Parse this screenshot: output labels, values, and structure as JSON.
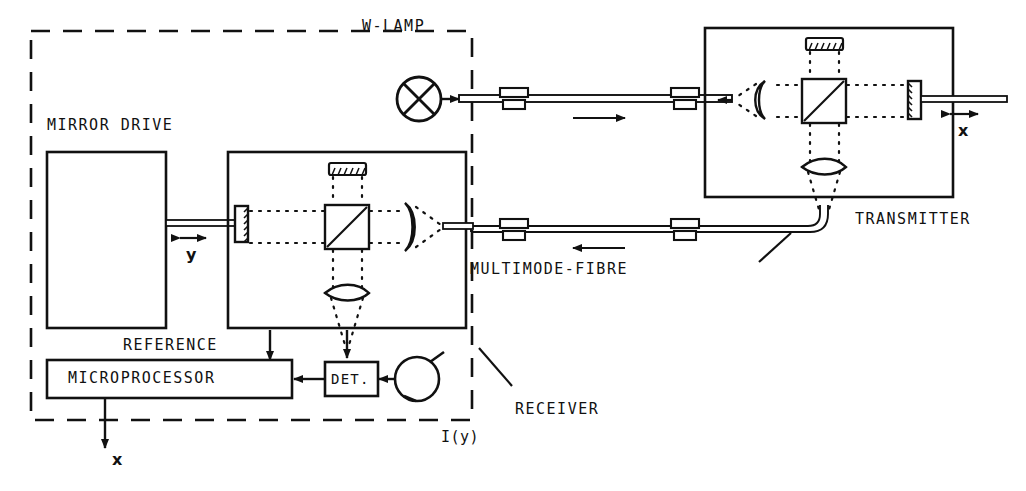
{
  "figure": {
    "stroke_color": "#111111",
    "background_color": "#ffffff"
  },
  "labels": {
    "w_lamp": "W-LAMP",
    "mirror_drive": "MIRROR DRIVE",
    "reference": "REFERENCE",
    "microprocessor": "MICROPROCESSOR",
    "detector": "DET.",
    "receiver": "RECEIVER",
    "transmitter": "TRANSMITTER",
    "multimode_fibre": "MULTIMODE-FIBRE",
    "intensity_signal": "I(y)",
    "mirror_travel_y": "y",
    "output_x": "x",
    "measurand_x": "x"
  },
  "components": {
    "receiver": {
      "name": "RECEIVER",
      "enclosure": "dashed",
      "blocks": [
        {
          "id": "mirror-drive",
          "label": "MIRROR DRIVE"
        },
        {
          "id": "receiver-interferometer",
          "label": ""
        },
        {
          "id": "microprocessor",
          "label": "MICROPROCESSOR"
        },
        {
          "id": "detector",
          "label": "DET."
        }
      ],
      "optics": [
        "scanning-mirror",
        "beamsplitter-cube",
        "fixed-grating-mirror",
        "collimating-lens",
        "focusing-lens"
      ],
      "source": "W-LAMP"
    },
    "transmitter": {
      "name": "TRANSMITTER",
      "enclosure": "solid",
      "optics": [
        "collimating-lens",
        "beamsplitter-cube",
        "fixed-grating-mirror",
        "measurement-mirror",
        "focusing-lens"
      ]
    },
    "links": [
      {
        "id": "fibre-out",
        "label": "MULTIMODE-FIBRE",
        "direction": "receiver-to-transmitter",
        "connectors": 2
      },
      {
        "id": "fibre-return",
        "label": "MULTIMODE-FIBRE",
        "direction": "transmitter-to-receiver",
        "connectors": 2
      }
    ]
  },
  "signals": {
    "reference_arrow": "REFERENCE",
    "intensity_arrow": "I(y)",
    "output_arrow": "x",
    "mirror_scan_arrow": "y",
    "measurand_arrow": "x"
  }
}
